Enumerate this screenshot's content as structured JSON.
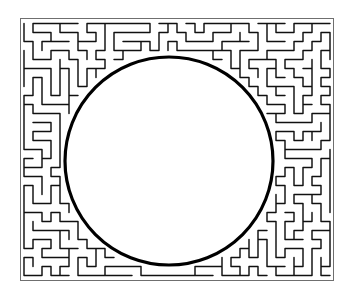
{
  "figure": {
    "caption": "with that of a class (0/10).",
    "background_color": "#ffffff",
    "ink_color": "#1a1a1a",
    "caption_color": "#8d8d8d",
    "width": 354,
    "height": 296
  },
  "plate": {
    "name": "maze-plate",
    "border": {
      "x": 20,
      "y": 18,
      "width": 314,
      "height": 263,
      "stroke_color": "#6f6f6f",
      "stroke_width": 1
    },
    "maze": {
      "type": "orthogonal-labyrinth",
      "cell_size": 9,
      "stroke_color": "#101010",
      "stroke_width": 1.45,
      "description": "dense space-filling rectilinear maze occupying the frame margin around the central disc"
    },
    "disc": {
      "center_x": 169,
      "center_y": 161,
      "radius": 104,
      "fill_color": "#ffffff",
      "stroke_color": "#000000",
      "stroke_width": 3.2
    }
  }
}
